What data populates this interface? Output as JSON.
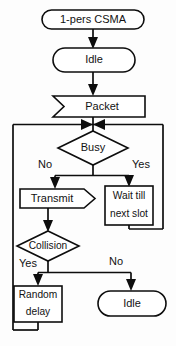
{
  "diagram": {
    "stroke_color": "#0d0d0d",
    "fill_color": "#ffffff",
    "background_color": "#fdfdfd",
    "nodes": {
      "start": {
        "label": "1-pers CSMA",
        "shape": "stadium"
      },
      "idle_top": {
        "label": "Idle",
        "shape": "oval"
      },
      "packet": {
        "label": "Packet",
        "shape": "data-input"
      },
      "busy": {
        "label": "Busy",
        "shape": "diamond"
      },
      "transmit": {
        "label": "Transmit",
        "shape": "arrow-box"
      },
      "wait_line1": {
        "label": "Wait till",
        "shape": "rect"
      },
      "wait_line2": {
        "label": "next slot",
        "shape": "rect"
      },
      "collision": {
        "label": "Collision",
        "shape": "diamond"
      },
      "random_line1": {
        "label": "Random",
        "shape": "rect"
      },
      "random_line2": {
        "label": "delay",
        "shape": "rect"
      },
      "idle_bottom": {
        "label": "Idle",
        "shape": "oval"
      }
    },
    "edge_labels": {
      "busy_no": "No",
      "busy_yes": "Yes",
      "collision_yes": "Yes",
      "collision_no": "No"
    }
  }
}
